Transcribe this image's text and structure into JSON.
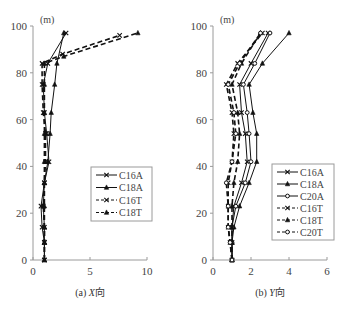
{
  "chart_data": [
    {
      "type": "line",
      "title": "(a) X向",
      "caption_prefix": "(a) ",
      "caption_axis": "X",
      "caption_suffix": "向",
      "xlabel": "",
      "ylabel": "(m)",
      "xlim": [
        0,
        10
      ],
      "ylim": [
        0,
        100
      ],
      "xticks": [
        0,
        5,
        10
      ],
      "yticks": [
        0,
        20,
        40,
        60,
        80,
        100
      ],
      "grid": false,
      "legend_position": "lower right",
      "series": [
        {
          "name": "C16A",
          "style": "solid",
          "marker": "x",
          "points": [
            [
              1.0,
              0
            ],
            [
              1.0,
              7.5
            ],
            [
              0.8,
              14
            ],
            [
              0.7,
              23
            ],
            [
              1.0,
              33
            ],
            [
              1.4,
              42
            ],
            [
              1.2,
              54
            ],
            [
              1.0,
              63
            ],
            [
              0.9,
              75
            ],
            [
              1.3,
              84
            ],
            [
              2.9,
              97
            ]
          ]
        },
        {
          "name": "C18A",
          "style": "solid",
          "marker": "triangle",
          "points": [
            [
              1.0,
              0
            ],
            [
              1.0,
              7.5
            ],
            [
              1.0,
              14
            ],
            [
              0.9,
              23
            ],
            [
              1.0,
              33
            ],
            [
              1.3,
              42
            ],
            [
              1.5,
              54
            ],
            [
              1.6,
              63
            ],
            [
              1.9,
              75
            ],
            [
              2.1,
              84
            ],
            [
              2.7,
              97
            ]
          ]
        },
        {
          "name": "C16T",
          "style": "dashed",
          "marker": "x",
          "points": [
            [
              1.0,
              0
            ],
            [
              1.0,
              7.5
            ],
            [
              1.0,
              14
            ],
            [
              0.9,
              23
            ],
            [
              1.0,
              33
            ],
            [
              1.1,
              42
            ],
            [
              1.1,
              54
            ],
            [
              0.9,
              63
            ],
            [
              0.8,
              75
            ],
            [
              0.8,
              84
            ],
            [
              2.6,
              88
            ],
            [
              7.6,
              96
            ]
          ]
        },
        {
          "name": "C18T",
          "style": "dashed",
          "marker": "triangle",
          "points": [
            [
              1.0,
              0
            ],
            [
              1.0,
              7.5
            ],
            [
              1.0,
              14
            ],
            [
              1.0,
              23
            ],
            [
              1.0,
              33
            ],
            [
              1.0,
              42
            ],
            [
              1.0,
              54
            ],
            [
              1.0,
              63
            ],
            [
              1.0,
              75
            ],
            [
              1.0,
              84
            ],
            [
              2.7,
              87
            ],
            [
              9.2,
              97
            ]
          ]
        }
      ]
    },
    {
      "type": "line",
      "title": "(b) Y向",
      "caption_prefix": "(b) ",
      "caption_axis": "Y",
      "caption_suffix": "向",
      "xlabel": "",
      "ylabel": "(m)",
      "xlim": [
        0,
        6
      ],
      "ylim": [
        0,
        100
      ],
      "xticks": [
        0,
        2,
        4,
        6
      ],
      "yticks": [
        0,
        20,
        40,
        60,
        80,
        100
      ],
      "grid": false,
      "legend_position": "lower right",
      "series": [
        {
          "name": "C16A",
          "style": "solid",
          "marker": "x",
          "points": [
            [
              1.0,
              0
            ],
            [
              1.0,
              7.5
            ],
            [
              1.0,
              14
            ],
            [
              1.1,
              23
            ],
            [
              1.5,
              33
            ],
            [
              1.8,
              42
            ],
            [
              1.7,
              54
            ],
            [
              1.5,
              63
            ],
            [
              1.4,
              75
            ],
            [
              2.0,
              84
            ],
            [
              2.9,
              97
            ]
          ]
        },
        {
          "name": "C18A",
          "style": "solid",
          "marker": "triangle",
          "points": [
            [
              1.0,
              0
            ],
            [
              1.0,
              7.5
            ],
            [
              1.1,
              14
            ],
            [
              1.4,
              23
            ],
            [
              1.9,
              33
            ],
            [
              2.3,
              42
            ],
            [
              2.3,
              54
            ],
            [
              2.1,
              63
            ],
            [
              1.9,
              75
            ],
            [
              2.6,
              84
            ],
            [
              4.0,
              97
            ]
          ]
        },
        {
          "name": "C20A",
          "style": "solid",
          "marker": "circle",
          "points": [
            [
              1.0,
              0
            ],
            [
              1.0,
              7.5
            ],
            [
              1.0,
              14
            ],
            [
              1.2,
              23
            ],
            [
              1.7,
              33
            ],
            [
              2.0,
              42
            ],
            [
              1.9,
              54
            ],
            [
              1.8,
              63
            ],
            [
              1.6,
              75
            ],
            [
              2.2,
              84
            ],
            [
              3.0,
              97
            ]
          ]
        },
        {
          "name": "C16T",
          "style": "dashed",
          "marker": "x",
          "points": [
            [
              1.0,
              0
            ],
            [
              0.9,
              7.5
            ],
            [
              0.8,
              14
            ],
            [
              0.8,
              23
            ],
            [
              0.8,
              33
            ],
            [
              1.0,
              42
            ],
            [
              1.1,
              54
            ],
            [
              1.0,
              63
            ],
            [
              0.7,
              75
            ],
            [
              1.3,
              84
            ],
            [
              2.6,
              97
            ]
          ]
        },
        {
          "name": "C18T",
          "style": "dashed",
          "marker": "triangle",
          "points": [
            [
              1.0,
              0
            ],
            [
              1.0,
              7.5
            ],
            [
              1.0,
              14
            ],
            [
              1.0,
              23
            ],
            [
              1.1,
              33
            ],
            [
              1.3,
              42
            ],
            [
              1.4,
              54
            ],
            [
              1.3,
              63
            ],
            [
              1.0,
              75
            ],
            [
              1.5,
              84
            ],
            [
              2.5,
              97
            ]
          ]
        },
        {
          "name": "C20T",
          "style": "dashed",
          "marker": "circle",
          "points": [
            [
              1.0,
              0
            ],
            [
              0.9,
              7.5
            ],
            [
              0.8,
              14
            ],
            [
              0.8,
              23
            ],
            [
              0.7,
              33
            ],
            [
              1.0,
              42
            ],
            [
              1.2,
              54
            ],
            [
              1.1,
              63
            ],
            [
              0.8,
              75
            ],
            [
              1.4,
              84
            ],
            [
              2.5,
              97
            ]
          ]
        }
      ]
    }
  ],
  "colors": {
    "axis": "#9a9a9a",
    "line": "#111111",
    "text": "#444444",
    "legend_border": "#9a9a9a"
  }
}
